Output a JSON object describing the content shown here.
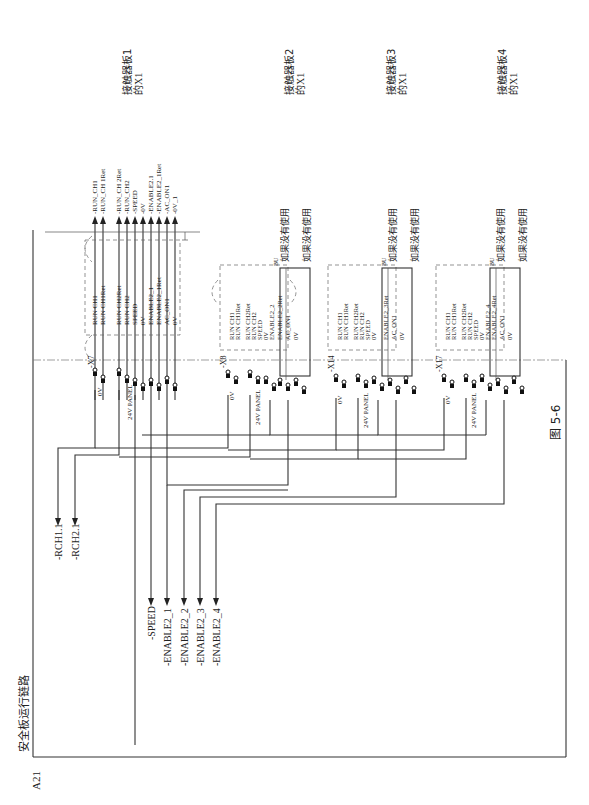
{
  "figure": {
    "module_id": "A21",
    "title": "安全板运行链路",
    "caption": "图 5-6"
  },
  "outputs_left": [
    {
      "label": "-RCH1.1"
    },
    {
      "label": "-RCH2.1"
    },
    {
      "label": "-SPEED"
    },
    {
      "label": "-ENABLE2_1"
    },
    {
      "label": "-ENABLE2_2"
    },
    {
      "label": "-ENABLE2_3"
    },
    {
      "label": "-ENABLE2_4"
    }
  ],
  "boards": [
    {
      "connector": "-X7",
      "target": {
        "line1": "接触器板1",
        "line2": "的X1"
      },
      "pin_labels": {
        "p1": "1",
        "p2": "2",
        "p3": "3",
        "p4": "4",
        "p5": "5",
        "p6": "6",
        "p7": "7",
        "p8": "8",
        "p9": "9",
        "p10": "10"
      },
      "side_labels": {
        "zero_v": "0V",
        "panel": "24V PANEL"
      },
      "cable_signals": [
        "RUN CH1",
        "RUN CH1Ret",
        "RUN CH2Ret",
        "RUN CH2",
        "SPEED",
        "0V",
        "ENABLE2_1",
        "ENABLE2_1Ret",
        "AC_ON1",
        "0V"
      ],
      "arrow_signals": [
        "-RUN_CH1",
        "-RUN_CH 1Ret",
        "-RUN_CH 2Ret",
        "-RUN_CH2",
        "-SPEED",
        "-0V",
        "-ENABLE2.1",
        "-ENABLE2_1Ret",
        "-AC_ON1",
        "-0V_1"
      ]
    },
    {
      "connector": "-X8",
      "target": {
        "line1": "接触器板2",
        "line2": "的X1"
      },
      "pin_labels": {
        "p1": "1",
        "p2": "2",
        "p3": "3",
        "p4": "4",
        "p5": "5",
        "p6": "6",
        "p7": "7",
        "p8": "8",
        "p9": "9",
        "p10": "10"
      },
      "side_labels": {
        "zero_v": "0V",
        "panel": "24V PANEL"
      },
      "cable_signals": [
        "RUN CH1",
        "RUN CH1Ret",
        "RUN CH2Ret",
        "RUN CH2",
        "SPEED",
        "0V",
        "ENABLE2_2",
        "ENABLE2_2Ret",
        "AC_ON1",
        "0V"
      ],
      "bu_label": "BU",
      "note": "如果没有使用"
    },
    {
      "connector": "-X14",
      "target": {
        "line1": "接触器板3",
        "line2": "的X1"
      },
      "pin_labels": {
        "p1": "1",
        "p2": "2",
        "p3": "3",
        "p4": "4",
        "p5": "5",
        "p6": "6",
        "p7": "7",
        "p8": "8",
        "p9": "9",
        "p10": "10"
      },
      "side_labels": {
        "zero_v": "0V",
        "panel": "24V PANEL"
      },
      "cable_signals": [
        "RUN CH1",
        "RUN CH1Ret",
        "RUN CH2Ret",
        "RUN CH2",
        "SPEED",
        "0V",
        "ENABLE2_3",
        "ENABLE2_3Ret",
        "AC_ON1",
        "0V"
      ],
      "bu_label": "BU",
      "note": "如果没有使用"
    },
    {
      "connector": "-X17",
      "target": {
        "line1": "接触器板4",
        "line2": "的X1"
      },
      "pin_labels": {
        "p1": "1",
        "p2": "2",
        "p3": "3",
        "p4": "4",
        "p5": "5",
        "p6": "6",
        "p7": "7",
        "p8": "8",
        "p9": "9",
        "p10": "10"
      },
      "side_labels": {
        "zero_v": "0V",
        "panel": "24V PANEL"
      },
      "cable_signals": [
        "RUN CH1",
        "RUN CH1Ret",
        "RUN CH2Ret",
        "RUN CH2",
        "SPEED",
        "0V",
        "ENABLE2_4",
        "ENABLE2_4Ret",
        "AC_ON1",
        "0V"
      ],
      "bu_label": "BU",
      "note": "如果没有使用"
    }
  ]
}
